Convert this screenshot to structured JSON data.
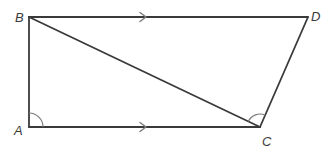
{
  "diagram": {
    "type": "trapezoid",
    "vertices": {
      "A": {
        "label": "A",
        "x": 29,
        "y": 127
      },
      "B": {
        "label": "B",
        "x": 29,
        "y": 17
      },
      "C": {
        "label": "C",
        "x": 260,
        "y": 127
      },
      "D": {
        "label": "D",
        "x": 308,
        "y": 17
      }
    },
    "segments": [
      {
        "from": "B",
        "to": "D",
        "parallel_marker": true
      },
      {
        "from": "A",
        "to": "C",
        "parallel_marker": true
      },
      {
        "from": "A",
        "to": "B"
      },
      {
        "from": "C",
        "to": "D"
      },
      {
        "from": "B",
        "to": "C",
        "role": "diagonal"
      }
    ],
    "angle_marks": [
      {
        "at": "A",
        "between": [
          "B",
          "C"
        ]
      },
      {
        "at": "C",
        "between": [
          "B",
          "D"
        ]
      }
    ],
    "colors": {
      "line": "#3a3a3a",
      "marker": "#7a7a7a",
      "background": "#ffffff"
    }
  }
}
